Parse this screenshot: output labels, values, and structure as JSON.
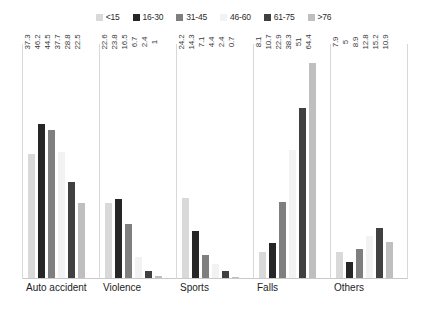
{
  "chart_data": {
    "type": "bar",
    "title": "",
    "subtitle": "",
    "xlabel": "",
    "ylabel": "",
    "ylim": [
      0,
      70
    ],
    "grid": false,
    "legend_position": "top-center",
    "label_orientation": "vertical",
    "categories": [
      "Auto accident",
      "Violence",
      "Sports",
      "Falls",
      "Others"
    ],
    "series": [
      {
        "name": "<15",
        "color": "#d9d9d9",
        "values": [
          37.3,
          22.6,
          24.2,
          8.1,
          7.9
        ]
      },
      {
        "name": "16-30",
        "color": "#262626",
        "values": [
          46.2,
          23.8,
          14.3,
          10.7,
          5
        ]
      },
      {
        "name": "31-45",
        "color": "#7f7f7f",
        "values": [
          44.5,
          16.5,
          7.1,
          22.9,
          8.9
        ]
      },
      {
        "name": "46-60",
        "color": "#f2f2f2",
        "values": [
          37.7,
          6.7,
          4.4,
          38.3,
          12.8
        ]
      },
      {
        "name": "61-75",
        "color": "#404040",
        "values": [
          28.8,
          2.4,
          2.4,
          51,
          15.2
        ]
      },
      {
        "name": ">76",
        "color": "#bfbfbf",
        "values": [
          22.5,
          1,
          0.7,
          64.4,
          10.9
        ]
      }
    ]
  },
  "legend": {
    "items": [
      {
        "label": "<15",
        "swatch": "legend-swatch-lt15"
      },
      {
        "label": "16-30",
        "swatch": "legend-swatch-16-30"
      },
      {
        "label": "31-45",
        "swatch": "legend-swatch-31-45"
      },
      {
        "label": "46-60",
        "swatch": "legend-swatch-46-60"
      },
      {
        "label": "61-75",
        "swatch": "legend-swatch-61-75"
      },
      {
        "label": ">76",
        "swatch": "legend-swatch-gt76"
      }
    ]
  }
}
